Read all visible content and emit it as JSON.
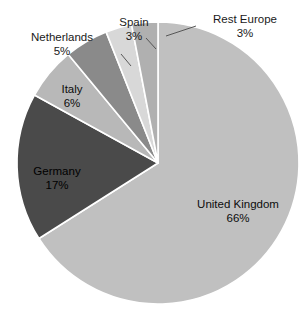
{
  "chart_data": {
    "type": "pie",
    "title": "",
    "subtitle": "",
    "xlabel": "",
    "ylabel": "",
    "legend_position": "none",
    "grid": false,
    "total_percent": 100,
    "categories": [
      "United Kingdom",
      "Germany",
      "Italy",
      "Netherlands",
      "Spain",
      "Rest Europe"
    ],
    "values": [
      66,
      17,
      6,
      5,
      3,
      3
    ],
    "value_labels": [
      "66%",
      "17%",
      "6%",
      "5%",
      "3%",
      "3%"
    ],
    "colors": [
      "#c0c0c0",
      "#4a4a4a",
      "#b8b8b8",
      "#8a8a8a",
      "#d8d8d8",
      "#b0b0b0"
    ],
    "slices": [
      {
        "name": "United Kingdom",
        "value": 66,
        "value_label": "66%",
        "color": "#c0c0c0",
        "label_placement": "inside"
      },
      {
        "name": "Germany",
        "value": 17,
        "value_label": "17%",
        "color": "#4a4a4a",
        "label_placement": "inside"
      },
      {
        "name": "Italy",
        "value": 6,
        "value_label": "6%",
        "color": "#b8b8b8",
        "label_placement": "inside"
      },
      {
        "name": "Netherlands",
        "value": 5,
        "value_label": "5%",
        "color": "#8a8a8a",
        "label_placement": "outside"
      },
      {
        "name": "Spain",
        "value": 3,
        "value_label": "3%",
        "color": "#d8d8d8",
        "label_placement": "outside"
      },
      {
        "name": "Rest Europe",
        "value": 3,
        "value_label": "3%",
        "color": "#b0b0b0",
        "label_placement": "outside"
      }
    ]
  },
  "labels": {
    "united_kingdom": {
      "name": "United Kingdom",
      "value": "66%"
    },
    "germany": {
      "name": "Germany",
      "value": "17%"
    },
    "italy": {
      "name": "Italy",
      "value": "6%"
    },
    "netherlands": {
      "name": "Netherlands",
      "value": "5%"
    },
    "spain": {
      "name": "Spain",
      "value": "3%"
    },
    "rest_europe": {
      "name": "Rest Europe",
      "value": "3%"
    }
  }
}
